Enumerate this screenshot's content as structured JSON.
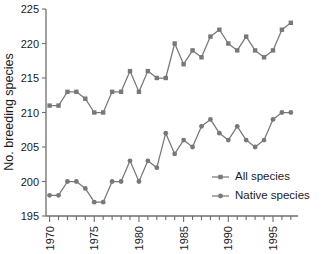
{
  "chart_data": {
    "type": "line",
    "title": "",
    "subtitle": "",
    "xlabel": "",
    "ylabel": "No. breeding species",
    "xlim": [
      1969.6,
      1997.8
    ],
    "ylim": [
      195,
      225
    ],
    "grid": false,
    "legend_position": "lower-right",
    "x": [
      1970,
      1971,
      1972,
      1973,
      1974,
      1975,
      1976,
      1977,
      1978,
      1979,
      1980,
      1981,
      1982,
      1983,
      1984,
      1985,
      1986,
      1987,
      1988,
      1989,
      1990,
      1991,
      1992,
      1993,
      1994,
      1995,
      1996,
      1997
    ],
    "x_tick_labels": [
      "1970",
      "1975",
      "1980",
      "1985",
      "1990",
      "1995"
    ],
    "x_tick_values": [
      1970,
      1975,
      1980,
      1985,
      1990,
      1995
    ],
    "x_minor_ticks_every": 1,
    "y_tick_labels": [
      "195",
      "200",
      "205",
      "210",
      "215",
      "220",
      "225"
    ],
    "y_tick_values": [
      195,
      200,
      205,
      210,
      215,
      220,
      225
    ],
    "series": [
      {
        "name": "All species",
        "marker": "square",
        "color": "#787878",
        "values": [
          211,
          211,
          213,
          213,
          212,
          210,
          210,
          213,
          213,
          216,
          213,
          216,
          215,
          215,
          220,
          217,
          219,
          218,
          221,
          222,
          220,
          219,
          221,
          219,
          218,
          219,
          222,
          223
        ]
      },
      {
        "name": "Native species",
        "marker": "circle",
        "color": "#787878",
        "values": [
          198,
          198,
          200,
          200,
          199,
          197,
          197,
          200,
          200,
          203,
          200,
          203,
          202,
          207,
          204,
          206,
          205,
          208,
          209,
          207,
          206,
          208,
          206,
          205,
          206,
          209,
          210,
          210
        ]
      }
    ]
  },
  "legend": {
    "items": [
      {
        "label": "All species",
        "marker": "square"
      },
      {
        "label": "Native species",
        "marker": "circle"
      }
    ]
  }
}
